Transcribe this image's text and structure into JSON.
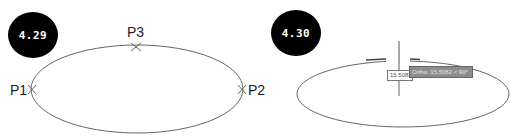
{
  "figures": [
    {
      "badge": "4.29",
      "points": [
        {
          "name": "P1",
          "label": "P1"
        },
        {
          "name": "P2",
          "label": "P2"
        },
        {
          "name": "P3",
          "label": "P3"
        }
      ]
    },
    {
      "badge": "4.30",
      "dynamic_input": {
        "value": "15.5082"
      },
      "tooltip": {
        "text": "Ortho: 15.5082 < 90°"
      }
    }
  ],
  "colors": {
    "badge_bg": "#000000",
    "badge_text": "#ffffff",
    "ellipse": "#555555",
    "tooltip_bg": "#8c8c8c"
  }
}
